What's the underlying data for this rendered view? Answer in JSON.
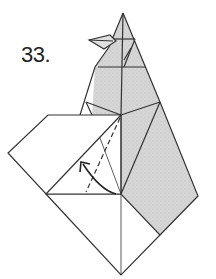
{
  "step": {
    "number": "33."
  },
  "diagram": {
    "colors": {
      "shaded": "#d4d4d4",
      "paper": "#ffffff",
      "line": "#333333"
    },
    "annotations": [
      {
        "type": "valley-fold-line",
        "style": "dashed"
      },
      {
        "type": "fold-arrow",
        "direction": "up-left"
      }
    ]
  }
}
